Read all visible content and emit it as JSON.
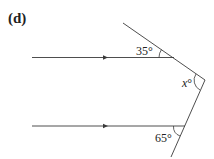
{
  "figure": {
    "part_label": "(d)",
    "angles": {
      "top": "35°",
      "apex_var": "x",
      "apex_deg": "°",
      "bottom": "65°"
    },
    "colors": {
      "line": "#3a3a3a",
      "text": "#222222",
      "background": "#ffffff"
    }
  }
}
